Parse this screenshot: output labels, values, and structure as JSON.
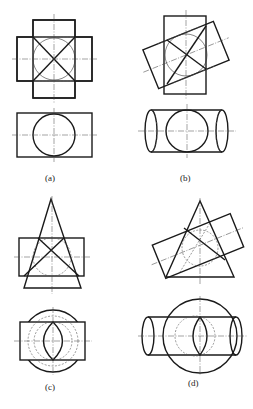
{
  "figure": {
    "panels": [
      {
        "id": "a",
        "label": "(a)",
        "description": "Two equal cylinders intersecting at right angles; top view cross shape, bottom view rectangle with circle"
      },
      {
        "id": "b",
        "label": "(b)",
        "description": "Two equal cylinders intersecting at an oblique angle; bottom view cylinder with end ellipses and circle"
      },
      {
        "id": "c",
        "label": "(c)",
        "description": "Cone intersecting a cylinder coaxial-tangent to common sphere; bottom view rectangle with circles and lens"
      },
      {
        "id": "d",
        "label": "(d)",
        "description": "Cone intersecting an inclined cylinder tangent to common sphere; bottom view with large circle, cylinder and lens"
      }
    ]
  }
}
